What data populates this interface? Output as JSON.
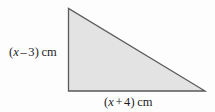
{
  "figure": {
    "name": "right-triangle-diagram",
    "shape": "right triangle",
    "fill_color": "#e3e3e3",
    "stroke_color": "#5a5a5a",
    "background_color": "#fdfdfd",
    "vertices": {
      "apex": [
        68,
        8
      ],
      "bottom_left": [
        68,
        91
      ],
      "bottom_right": [
        205,
        91
      ]
    }
  },
  "labels": {
    "height": {
      "full_text": "(x – 3) cm",
      "open_paren": "(",
      "variable": "x",
      "operator": "–",
      "constant": "3",
      "close_paren": ")",
      "unit": "cm"
    },
    "base": {
      "full_text": "(x + 4) cm",
      "open_paren": "(",
      "variable": "x",
      "operator": "+",
      "constant": "4",
      "close_paren": ")",
      "unit": "cm"
    }
  }
}
